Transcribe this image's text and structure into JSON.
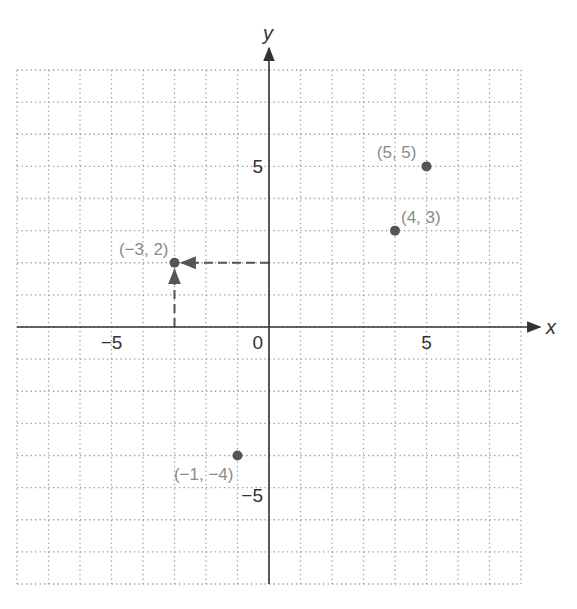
{
  "chart_data": {
    "type": "scatter",
    "title": "",
    "xlabel": "x",
    "ylabel": "y",
    "xlim": [
      -8,
      8
    ],
    "ylim": [
      -8,
      8
    ],
    "grid": true,
    "grid_style": "dotted",
    "x_ticks": [
      {
        "value": -5,
        "label": "−5"
      },
      {
        "value": 0,
        "label": "0"
      },
      {
        "value": 5,
        "label": "5"
      }
    ],
    "y_ticks": [
      {
        "value": 5,
        "label": "5"
      },
      {
        "value": -5,
        "label": "−5"
      }
    ],
    "points": [
      {
        "x": 5,
        "y": 5,
        "label": "(5, 5)"
      },
      {
        "x": 4,
        "y": 3,
        "label": "(4, 3)"
      },
      {
        "x": -3,
        "y": 2,
        "label": "(−3, 2)"
      },
      {
        "x": -1,
        "y": -4,
        "label": "(−1, −4)"
      }
    ],
    "annotations": [
      {
        "type": "dashed-arrow",
        "from": [
          0,
          2
        ],
        "to": [
          -3,
          2
        ]
      },
      {
        "type": "dashed-arrow",
        "from": [
          -3,
          0
        ],
        "to": [
          -3,
          2
        ]
      }
    ]
  },
  "colors": {
    "axis": "#333333",
    "grid": "#9a9a9a",
    "point": "#555555",
    "point_label": "#8a8a8a",
    "dashed_arrow": "#555555"
  }
}
